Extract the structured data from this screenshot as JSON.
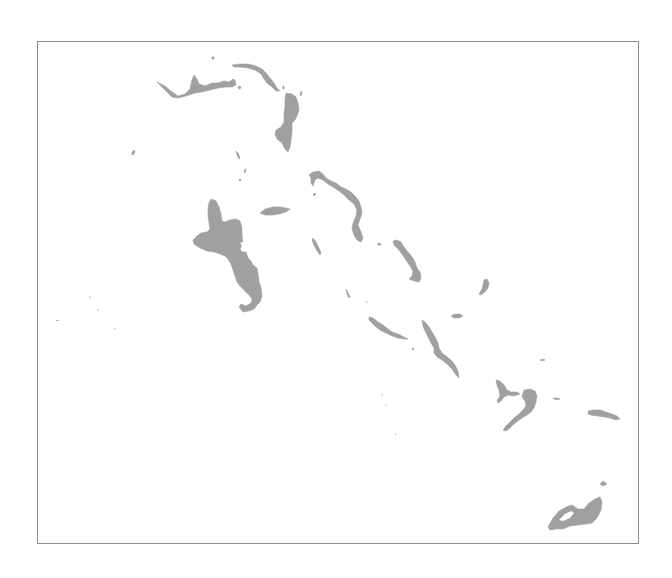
{
  "map": {
    "title": "The Bahamas",
    "land_color": "#a0a0a0",
    "frame_color": "#8c8c8c",
    "background_color": "#ffffff",
    "islands": [
      {
        "id": "grand-bahama",
        "name": "Grand Bahama"
      },
      {
        "id": "abaco",
        "name": "Abaco"
      },
      {
        "id": "andros",
        "name": "Andros"
      },
      {
        "id": "new-providence",
        "name": "New Providence"
      },
      {
        "id": "eleuthera",
        "name": "Eleuthera"
      },
      {
        "id": "exuma",
        "name": "Exuma"
      },
      {
        "id": "cat-island",
        "name": "Cat Island"
      },
      {
        "id": "san-salvador",
        "name": "San Salvador"
      },
      {
        "id": "rum-cay",
        "name": "Rum Cay"
      },
      {
        "id": "long-island",
        "name": "Long Island"
      },
      {
        "id": "ragged-island",
        "name": "Ragged Island chain"
      },
      {
        "id": "crooked-acklins",
        "name": "Crooked Island & Acklins"
      },
      {
        "id": "mayaguana",
        "name": "Mayaguana"
      },
      {
        "id": "great-inagua",
        "name": "Great Inagua"
      },
      {
        "id": "little-inagua",
        "name": "Little Inagua"
      },
      {
        "id": "bimini",
        "name": "Bimini"
      },
      {
        "id": "berry-islands",
        "name": "Berry Islands"
      }
    ]
  }
}
